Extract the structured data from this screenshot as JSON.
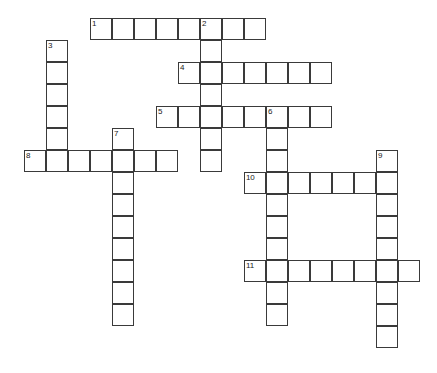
{
  "puzzle": {
    "type": "crossword-grid",
    "title": "",
    "cell_size": 22,
    "origin": {
      "x": 24,
      "y": 18
    },
    "grid_cols": 18,
    "grid_rows": 16,
    "background_color": "#ffffff",
    "cell_border_color": "#3a3a3a",
    "number_color": "#1a1a1a",
    "entries": [
      {
        "number": "1",
        "direction": "across",
        "col": 3,
        "row": 0,
        "length": 8
      },
      {
        "number": "2",
        "direction": "down",
        "col": 8,
        "row": 0,
        "length": 7
      },
      {
        "number": "3",
        "direction": "down",
        "col": 1,
        "row": 1,
        "length": 6
      },
      {
        "number": "4",
        "direction": "across",
        "col": 7,
        "row": 2,
        "length": 7
      },
      {
        "number": "5",
        "direction": "across",
        "col": 6,
        "row": 4,
        "length": 8
      },
      {
        "number": "6",
        "direction": "down",
        "col": 11,
        "row": 4,
        "length": 10
      },
      {
        "number": "7",
        "direction": "down",
        "col": 4,
        "row": 5,
        "length": 9
      },
      {
        "number": "8",
        "direction": "across",
        "col": 0,
        "row": 6,
        "length": 7
      },
      {
        "number": "9",
        "direction": "down",
        "col": 16,
        "row": 6,
        "length": 9
      },
      {
        "number": "10",
        "direction": "across",
        "col": 10,
        "row": 7,
        "length": 6
      },
      {
        "number": "11",
        "direction": "across",
        "col": 10,
        "row": 11,
        "length": 8
      }
    ],
    "filled_letters": []
  }
}
